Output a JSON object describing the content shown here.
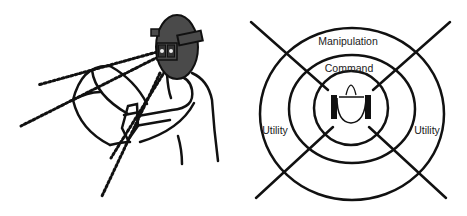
{
  "left_figure": {
    "description": "Person wearing a head-mounted display viewing a curved virtual panel with sight lines",
    "hmd_color": "#4a4a4a",
    "stroke_color": "#111111"
  },
  "right_figure": {
    "rings": [
      {
        "name": "command",
        "label": "Command"
      },
      {
        "name": "manipulation",
        "label": "Manipulation"
      }
    ],
    "side_labels": {
      "left": "Utility",
      "right": "Utility"
    },
    "stroke_color": "#111111",
    "center_icon": "user-with-hmd-icon"
  }
}
